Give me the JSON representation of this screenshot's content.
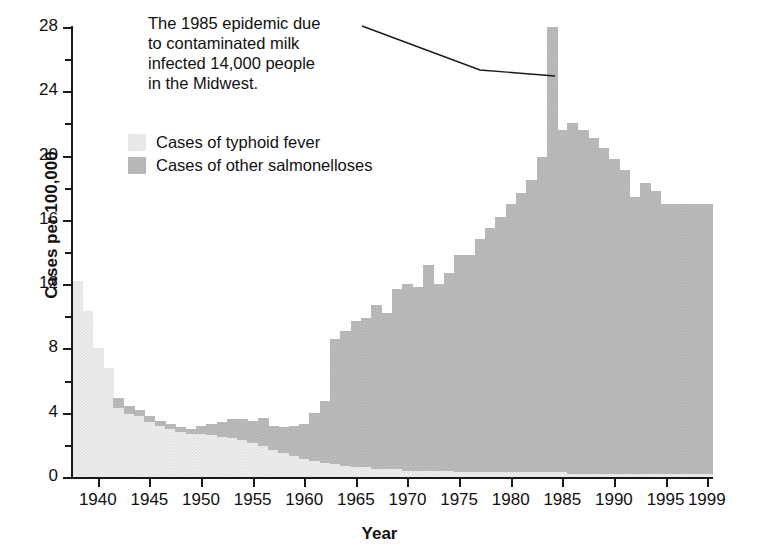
{
  "chart_data": {
    "type": "bar",
    "title": "",
    "subtitle": "",
    "xlabel": "Year",
    "ylabel": "Cases per 100,000",
    "xlim": [
      1937.5,
      1999.5
    ],
    "ylim": [
      0,
      28
    ],
    "grid": false,
    "stacked": true,
    "legend_position": "upper-left-inside",
    "y_ticks_major": [
      0,
      4,
      8,
      12,
      16,
      20,
      24,
      28
    ],
    "y_ticks_minor": [
      2,
      6,
      10,
      14,
      18,
      22,
      26
    ],
    "x_tick_labels": [
      "1940",
      "1945",
      "1950",
      "1955",
      "1960",
      "1965",
      "1970",
      "1975",
      "1980",
      "1985",
      "1990",
      "1995",
      "1999"
    ],
    "x_tick_values": [
      1940,
      1945,
      1950,
      1955,
      1960,
      1965,
      1970,
      1975,
      1980,
      1985,
      1990,
      1995,
      1999
    ],
    "x": [
      1938,
      1939,
      1940,
      1941,
      1942,
      1943,
      1944,
      1945,
      1946,
      1947,
      1948,
      1949,
      1950,
      1951,
      1952,
      1953,
      1954,
      1955,
      1956,
      1957,
      1958,
      1959,
      1960,
      1961,
      1962,
      1963,
      1964,
      1965,
      1966,
      1967,
      1968,
      1969,
      1970,
      1971,
      1972,
      1973,
      1974,
      1975,
      1976,
      1977,
      1978,
      1979,
      1980,
      1981,
      1982,
      1983,
      1984,
      1985,
      1986,
      1987,
      1988,
      1989,
      1990,
      1991,
      1992,
      1993,
      1994,
      1995,
      1996,
      1997,
      1998,
      1999
    ],
    "series": [
      {
        "name": "Cases of typhoid fever",
        "color": "#e2e2e2",
        "values": [
          12.2,
          10.3,
          8.0,
          6.8,
          4.3,
          3.9,
          3.8,
          3.4,
          3.2,
          3.0,
          2.8,
          2.7,
          2.7,
          2.6,
          2.5,
          2.4,
          2.3,
          2.1,
          1.9,
          1.7,
          1.5,
          1.3,
          1.1,
          1.0,
          0.9,
          0.8,
          0.7,
          0.6,
          0.6,
          0.5,
          0.5,
          0.5,
          0.4,
          0.4,
          0.4,
          0.4,
          0.4,
          0.3,
          0.3,
          0.3,
          0.3,
          0.3,
          0.3,
          0.3,
          0.3,
          0.3,
          0.3,
          0.3,
          0.2,
          0.2,
          0.2,
          0.2,
          0.2,
          0.2,
          0.2,
          0.2,
          0.2,
          0.2,
          0.2,
          0.2,
          0.2,
          0.2
        ]
      },
      {
        "name": "Cases of other salmonelloses",
        "color": "#b2b2b2",
        "values": [
          0.0,
          0.0,
          0.0,
          0.0,
          0.6,
          0.5,
          0.4,
          0.4,
          0.3,
          0.3,
          0.3,
          0.3,
          0.5,
          0.7,
          0.9,
          1.2,
          1.3,
          1.4,
          1.8,
          1.5,
          1.6,
          1.9,
          2.2,
          3.0,
          3.8,
          7.8,
          8.4,
          9.1,
          9.3,
          10.2,
          9.7,
          11.2,
          11.6,
          11.4,
          12.8,
          11.6,
          12.3,
          13.5,
          13.5,
          14.5,
          15.2,
          15.9,
          16.7,
          17.4,
          18.2,
          19.6,
          27.7,
          21.3,
          21.8,
          21.4,
          20.9,
          20.3,
          19.6,
          18.9,
          17.2,
          18.1,
          17.6,
          16.8,
          16.8,
          16.8,
          16.8,
          16.8
        ]
      }
    ],
    "totals_note": "Stacked totals: 1938 = 12.2; 1984 spike = 28.0; 1999 = 17.0",
    "annotation": {
      "text_lines": [
        "The 1985 epidemic due",
        "to contaminated milk",
        "infected 14,000 people",
        "in the Midwest."
      ],
      "points_to_year": 1985,
      "points_to_value": 25.0
    }
  },
  "legend": {
    "items": [
      {
        "label": "Cases of typhoid fever",
        "swatch": "typhoid"
      },
      {
        "label": "Cases of other salmonelloses",
        "swatch": "other"
      }
    ]
  },
  "axes": {
    "y_title": "Cases per 100,000",
    "x_title": "Year"
  },
  "colors": {
    "typhoid": "#e2e2e2",
    "other": "#b2b2b2",
    "axis": "#1a1a1a",
    "text": "#111111",
    "background": "#ffffff"
  }
}
